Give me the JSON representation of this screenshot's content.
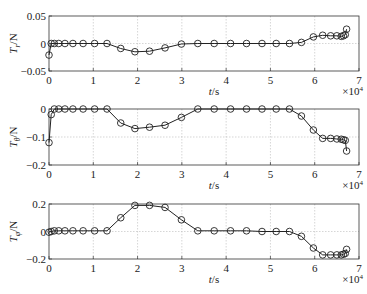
{
  "chart_data": [
    {
      "type": "line",
      "ylabel": "T_r/N",
      "ylabel_main": "T",
      "ylabel_sub": "r",
      "ylabel_unit": "/N",
      "xlabel": "t/s",
      "x_multiplier": "×10^4",
      "xlim": [
        0,
        7
      ],
      "ylim": [
        -0.05,
        0.05
      ],
      "yticks": [
        "0.05",
        "0",
        "−0.05"
      ],
      "ytick_values": [
        0.05,
        0,
        -0.05
      ],
      "xticks": [
        "0",
        "1",
        "2",
        "3",
        "4",
        "5",
        "6",
        "7"
      ],
      "grid": true,
      "marker": "circle",
      "x": [
        0,
        0.05,
        0.12,
        0.22,
        0.36,
        0.54,
        0.77,
        1.03,
        1.31,
        1.62,
        1.94,
        2.27,
        2.62,
        2.99,
        3.36,
        3.73,
        4.1,
        4.46,
        4.81,
        5.13,
        5.43,
        5.7,
        5.97,
        6.18,
        6.36,
        6.5,
        6.6,
        6.65,
        6.69,
        6.72
      ],
      "values": [
        -0.021,
        0,
        0,
        0,
        0,
        0,
        0,
        0,
        0,
        -0.009,
        -0.015,
        -0.014,
        -0.008,
        -0.001,
        0,
        0,
        0,
        0,
        0,
        0,
        0,
        0.002,
        0.012,
        0.015,
        0.014,
        0.014,
        0.013,
        0.014,
        0.016,
        0.026
      ]
    },
    {
      "type": "line",
      "ylabel": "T_θ/N",
      "ylabel_main": "T",
      "ylabel_sub": "θ",
      "ylabel_unit": "/N",
      "xlabel": "t/s",
      "x_multiplier": "×10^4",
      "xlim": [
        0,
        7
      ],
      "ylim": [
        -0.2,
        0
      ],
      "yticks": [
        "0",
        "−0.1",
        "−0.2"
      ],
      "ytick_values": [
        0,
        -0.1,
        -0.2
      ],
      "xticks": [
        "0",
        "1",
        "2",
        "3",
        "4",
        "5",
        "6",
        "7"
      ],
      "grid": true,
      "marker": "circle",
      "x": [
        0,
        0.05,
        0.12,
        0.22,
        0.36,
        0.54,
        0.77,
        1.03,
        1.31,
        1.62,
        1.94,
        2.27,
        2.62,
        2.99,
        3.36,
        3.73,
        4.1,
        4.46,
        4.81,
        5.13,
        5.43,
        5.7,
        5.97,
        6.18,
        6.36,
        6.5,
        6.6,
        6.65,
        6.69,
        6.72
      ],
      "values": [
        -0.12,
        -0.02,
        0,
        0,
        0,
        0,
        0,
        0,
        0,
        -0.05,
        -0.07,
        -0.065,
        -0.058,
        -0.03,
        0,
        0,
        0,
        0,
        0,
        0,
        0,
        -0.025,
        -0.075,
        -0.105,
        -0.105,
        -0.107,
        -0.108,
        -0.11,
        -0.112,
        -0.15
      ]
    },
    {
      "type": "line",
      "ylabel": "T_φ/N",
      "ylabel_main": "T",
      "ylabel_sub": "φ",
      "ylabel_unit": "/N",
      "xlabel": "t/s",
      "x_multiplier": "×10^4",
      "xlim": [
        0,
        7
      ],
      "ylim": [
        -0.2,
        0.2
      ],
      "yticks": [
        "0.2",
        "0",
        "−0.2"
      ],
      "ytick_values": [
        0.2,
        0,
        -0.2
      ],
      "xticks": [
        "0",
        "1",
        "2",
        "3",
        "4",
        "5",
        "6",
        "7"
      ],
      "grid": true,
      "marker": "circle",
      "x": [
        0,
        0.05,
        0.12,
        0.22,
        0.36,
        0.54,
        0.77,
        1.03,
        1.31,
        1.62,
        1.94,
        2.27,
        2.62,
        2.99,
        3.36,
        3.73,
        4.1,
        4.46,
        4.81,
        5.13,
        5.43,
        5.7,
        5.97,
        6.18,
        6.36,
        6.5,
        6.6,
        6.65,
        6.69,
        6.72
      ],
      "values": [
        -0.005,
        0,
        0.005,
        0.005,
        0.005,
        0.005,
        0.005,
        0.005,
        0.005,
        0.1,
        0.19,
        0.19,
        0.175,
        0.085,
        0.005,
        0.005,
        0.005,
        0.005,
        0,
        0,
        0,
        -0.035,
        -0.12,
        -0.17,
        -0.17,
        -0.17,
        -0.17,
        -0.165,
        -0.16,
        -0.13
      ]
    }
  ]
}
